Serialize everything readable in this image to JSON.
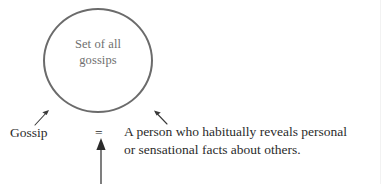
{
  "diagram": {
    "title_text": "Gossip definition set diagram",
    "set": {
      "label_line1": "Set of all",
      "label_line2": "gossips",
      "stroke_color": "#6b6b6b",
      "text_color": "#6f6f6f",
      "shape": "circle"
    },
    "term": {
      "label": "Gossip"
    },
    "equals": {
      "symbol": "="
    },
    "definition": {
      "line1": "A person who habitually reveals personal",
      "line2": "or sensational facts about others."
    },
    "annotations": {
      "arrow_left_name": "arrow-pointing-up-right-to-set",
      "arrow_right_name": "arrow-pointing-up-left-to-set",
      "arrow_bottom_name": "arrow-pointing-up-to-equals"
    },
    "colors": {
      "ink": "#2b2b2b",
      "set_stroke": "#6b6b6b",
      "set_text": "#6f6f6f",
      "background": "#ffffff"
    }
  }
}
